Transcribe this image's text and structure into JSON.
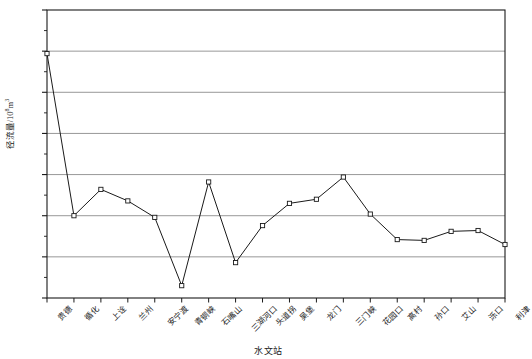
{
  "chart_data": {
    "type": "line",
    "title": "",
    "xlabel": "水文站",
    "ylabel_main": "径流量/10",
    "ylabel_exp": "8",
    "ylabel_unit": "m",
    "ylabel_unit_exp": "3",
    "ylabel_full": "径流量/10⁸m³",
    "categories": [
      "贵德",
      "循化",
      "上诠",
      "兰州",
      "安宁渡",
      "青铜峡",
      "石嘴山",
      "三湖河口",
      "头道拐",
      "吴堡",
      "龙门",
      "三门峡",
      "花园口",
      "高村",
      "孙口",
      "艾山",
      "泺口",
      "利津"
    ],
    "values": [
      197,
      0,
      32,
      18,
      -2,
      -85,
      41,
      -57,
      -12,
      15,
      20,
      47,
      2,
      -29,
      -30,
      -19,
      -18,
      -35
    ],
    "ylim": [
      -100,
      250
    ],
    "ytick_labels": [
      "250",
      "200",
      "150",
      "100",
      "50",
      "0",
      "-50",
      "-100"
    ],
    "ytick_values": [
      250,
      200,
      150,
      100,
      50,
      0,
      -50,
      -100
    ],
    "minor_tick_step": 25,
    "grid": true,
    "legend": "none",
    "marker": "open-square",
    "line_color": "#1a1a1a",
    "grid_color": "#8c8c8c",
    "axis_color": "#1a1a1a"
  }
}
